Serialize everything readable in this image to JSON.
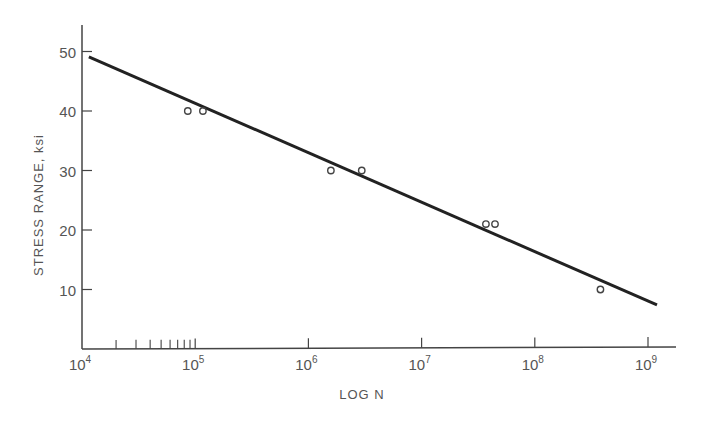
{
  "chart_data": {
    "type": "scatter",
    "title": "",
    "xlabel": "LOG N",
    "ylabel": "STRESS RANGE, ksi",
    "x_scale": "log",
    "xlim": [
      10000,
      2000000000
    ],
    "ylim": [
      0,
      55
    ],
    "x_ticks": [
      {
        "base": "10",
        "exp": "4",
        "value": 10000
      },
      {
        "base": "10",
        "exp": "5",
        "value": 100000
      },
      {
        "base": "10",
        "exp": "6",
        "value": 1000000
      },
      {
        "base": "10",
        "exp": "7",
        "value": 10000000
      },
      {
        "base": "10",
        "exp": "8",
        "value": 100000000
      },
      {
        "base": "10",
        "exp": "9",
        "value": 1000000000
      }
    ],
    "x_minor_ticks": [
      20000,
      30000,
      40000,
      50000,
      60000,
      70000,
      80000,
      90000
    ],
    "y_ticks": [
      {
        "label": "50",
        "value": 50
      },
      {
        "label": "40",
        "value": 40
      },
      {
        "label": "30",
        "value": 30
      },
      {
        "label": "20",
        "value": 20
      },
      {
        "label": "10",
        "value": 10
      }
    ],
    "grid": false,
    "legend": null,
    "series": [
      {
        "name": "Test data",
        "kind": "scatter",
        "marker": "open-circle",
        "points": [
          {
            "x": 86000,
            "y": 40
          },
          {
            "x": 117000,
            "y": 40
          },
          {
            "x": 1580000,
            "y": 30
          },
          {
            "x": 2960000,
            "y": 30
          },
          {
            "x": 37000000,
            "y": 21
          },
          {
            "x": 44500000,
            "y": 21
          },
          {
            "x": 380000000,
            "y": 10
          }
        ]
      },
      {
        "name": "Regression line",
        "kind": "line",
        "points": [
          {
            "x": 11500,
            "y": 49.1
          },
          {
            "x": 1200000000,
            "y": 7.4
          }
        ]
      }
    ],
    "colors": {
      "line": "#222222",
      "axis": "#444444",
      "text": "#555555",
      "marker": "#444444"
    }
  }
}
